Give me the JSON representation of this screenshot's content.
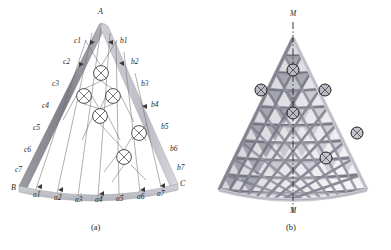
{
  "figure": {
    "title_hidden": "",
    "background_color": "#ffffff",
    "ink_color": "#2a2a2a",
    "panels": [
      {
        "id": "a",
        "caption": "(a)",
        "type": "schematic-line-diagram",
        "description": "Curved triangular grid shell layout with labelled boundary nodes and cross-marked interior nodes",
        "corner_labels": [
          {
            "name": "A",
            "text": "A",
            "x": 101,
            "y": 15
          },
          {
            "name": "B",
            "text": "B",
            "x": 16,
            "y": 190
          },
          {
            "name": "C",
            "text": "C",
            "x": 176,
            "y": 186
          }
        ],
        "edge_labels_left": [
          "c1",
          "c2",
          "c3",
          "c4",
          "c5",
          "c6",
          "c7"
        ],
        "edge_labels_right": [
          "b1",
          "b2",
          "b3",
          "b4",
          "b5",
          "b6",
          "b7"
        ],
        "edge_labels_bottom": [
          "a1",
          "a2",
          "a3",
          "a4",
          "a5",
          "a6",
          "a7"
        ],
        "c_label_positions": [
          {
            "label": "c1",
            "x": 76,
            "y": 41
          },
          {
            "label": "c2",
            "x": 65,
            "y": 62
          },
          {
            "label": "c3",
            "x": 54,
            "y": 83
          },
          {
            "label": "c4",
            "x": 44,
            "y": 105
          },
          {
            "label": "c5",
            "x": 35,
            "y": 127
          },
          {
            "label": "c6",
            "x": 26,
            "y": 149
          },
          {
            "label": "c7",
            "x": 17,
            "y": 169
          }
        ],
        "b_label_positions": [
          {
            "label": "b1",
            "x": 122,
            "y": 41
          },
          {
            "label": "b2",
            "x": 133,
            "y": 61
          },
          {
            "label": "b3",
            "x": 143,
            "y": 83
          },
          {
            "label": "b4",
            "x": 153,
            "y": 105
          },
          {
            "label": "b5",
            "x": 163,
            "y": 126
          },
          {
            "label": "b6",
            "x": 172,
            "y": 148
          },
          {
            "label": "b7",
            "x": 178,
            "y": 167
          }
        ],
        "a_label_positions": [
          {
            "label": "a1",
            "x": 36,
            "y": 194
          },
          {
            "label": "a2",
            "x": 57,
            "y": 196
          },
          {
            "label": "a3",
            "x": 77,
            "y": 198
          },
          {
            "label": "a4",
            "x": 98,
            "y": 198
          },
          {
            "label": "a5",
            "x": 119,
            "y": 197
          },
          {
            "label": "a6",
            "x": 140,
            "y": 195
          },
          {
            "label": "a7",
            "x": 160,
            "y": 192
          }
        ],
        "node_markers": [
          {
            "name": "cross-node-1",
            "x": 101,
            "y": 73,
            "r": 7.5
          },
          {
            "name": "cross-node-2",
            "x": 84,
            "y": 96,
            "r": 7.5
          },
          {
            "name": "cross-node-3",
            "x": 113,
            "y": 96,
            "r": 7.5
          },
          {
            "name": "cross-node-4",
            "x": 100,
            "y": 116,
            "r": 7.5
          },
          {
            "name": "cross-node-5",
            "x": 139,
            "y": 133,
            "r": 7.5
          },
          {
            "name": "cross-node-6",
            "x": 124,
            "y": 157,
            "r": 7.5
          }
        ],
        "marker_symbol": "circle-with-x"
      },
      {
        "id": "b",
        "caption": "(b)",
        "type": "rendered-3d-lattice",
        "description": "Shaded three-dimensional triangulated grid shell with vertical M-M section line and ring-marked joints",
        "section_line_label_top": "M",
        "section_line_label_bottom": "M",
        "section_line_style": "dash-dot",
        "rows": 9,
        "ring_markers": [
          {
            "name": "ring-node-1",
            "x": 98,
            "y": 70
          },
          {
            "name": "ring-node-2",
            "x": 66,
            "y": 90
          },
          {
            "name": "ring-node-3",
            "x": 130,
            "y": 90
          },
          {
            "name": "ring-node-4",
            "x": 98,
            "y": 113
          },
          {
            "name": "ring-node-5",
            "x": 162,
            "y": 133
          },
          {
            "name": "ring-node-6",
            "x": 131,
            "y": 158
          }
        ]
      }
    ]
  },
  "colors": {
    "band_dark": "#7d7d85",
    "band_light": "#c9c9cf",
    "line": "#6a6a6a",
    "member_mid": "#9a9aa6",
    "member_shadow": "#6d6d79",
    "member_light": "#d4d4dc",
    "text": "#2a2a2a"
  }
}
